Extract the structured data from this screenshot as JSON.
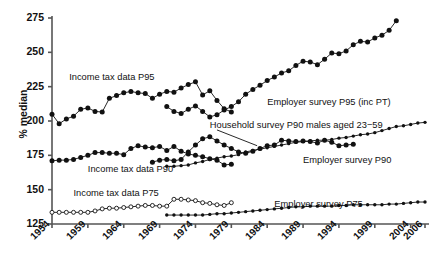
{
  "chart_data": {
    "type": "line",
    "title": "",
    "xlabel": "",
    "ylabel": "% median",
    "xlim": [
      1954,
      2006
    ],
    "ylim": [
      125,
      275
    ],
    "yticks": [
      125,
      150,
      175,
      200,
      225,
      250,
      275
    ],
    "xticks": [
      1954,
      1959,
      1964,
      1969,
      1974,
      1979,
      1984,
      1989,
      1994,
      1999,
      2004,
      2006
    ],
    "grid": false,
    "legend_position": "inline-annotations",
    "marker_styles": {
      "income_tax": "filled-circle",
      "household_survey": "filled-circle",
      "employer_survey_p95": "filled-circle",
      "employer_survey_p90": "small-filled-circle",
      "income_tax_p75": "open-circle",
      "employer_survey_p75": "small-filled-circle"
    },
    "annotations": [
      {
        "text": "Income tax data P95",
        "x": 1956.4,
        "y": 231.5
      },
      {
        "text": "Income tax data P90",
        "x": 1959.0,
        "y": 164.0
      },
      {
        "text": "Income tax data P75",
        "x": 1957.0,
        "y": 146.5
      },
      {
        "text": "Employer survey P95 (inc PT)",
        "x": 1984.0,
        "y": 213.0
      },
      {
        "text": "Household survey P90 males aged 23−59",
        "x": 1976.0,
        "y": 196.5
      },
      {
        "text": "Employer survey P90",
        "x": 1989.0,
        "y": 171.0
      },
      {
        "text": "Employer survey P75",
        "x": 1985.0,
        "y": 139.0
      }
    ],
    "series": [
      {
        "name": "Income tax data P95",
        "marker": "filled-circle",
        "x": [
          1954,
          1955,
          1956,
          1957,
          1958,
          1959,
          1960,
          1961,
          1962,
          1963,
          1964,
          1965,
          1966,
          1967,
          1968,
          1969,
          1970,
          1971,
          1972,
          1973,
          1974,
          1975,
          1976,
          1977,
          1978,
          1979
        ],
        "values": [
          205.0,
          198.0,
          201.5,
          203.5,
          208.5,
          209.5,
          207.0,
          206.5,
          216.5,
          218.5,
          220.5,
          221.5,
          220.5,
          220.0,
          216.5,
          219.5,
          221.5,
          221.0,
          224.0,
          226.5,
          228.5,
          219.0,
          222.0,
          215.0,
          209.0,
          206.5
        ]
      },
      {
        "name": "Income tax data P90",
        "marker": "filled-circle",
        "x": [
          1954,
          1955,
          1956,
          1957,
          1958,
          1959,
          1960,
          1961,
          1962,
          1963,
          1964,
          1965,
          1966,
          1967,
          1968,
          1969,
          1970,
          1971,
          1972,
          1973,
          1974,
          1975,
          1976,
          1977,
          1978,
          1979
        ],
        "values": [
          171.0,
          171.5,
          171.5,
          172.0,
          173.5,
          175.0,
          177.0,
          177.0,
          176.5,
          176.5,
          175.5,
          180.0,
          182.0,
          181.0,
          180.5,
          181.5,
          178.5,
          181.5,
          178.0,
          176.0,
          175.0,
          174.0,
          172.5,
          171.5,
          168.0,
          168.5
        ]
      },
      {
        "name": "Income tax data P75",
        "marker": "open-circle",
        "x": [
          1954,
          1955,
          1956,
          1957,
          1958,
          1959,
          1960,
          1961,
          1962,
          1963,
          1964,
          1965,
          1966,
          1967,
          1968,
          1969,
          1970,
          1971,
          1972,
          1973,
          1974,
          1975,
          1976,
          1977,
          1978,
          1979
        ],
        "values": [
          133.5,
          133.5,
          133.5,
          133.5,
          133.5,
          133.5,
          134.5,
          136.0,
          136.5,
          136.5,
          137.0,
          137.5,
          138.0,
          138.5,
          138.5,
          138.0,
          138.0,
          143.0,
          143.0,
          142.5,
          142.0,
          140.5,
          140.0,
          139.0,
          138.5,
          140.5
        ]
      },
      {
        "name": "Household survey P90 males aged 23−59",
        "marker": "filled-circle",
        "x": [
          1968,
          1969,
          1970,
          1971,
          1972,
          1973,
          1974,
          1975,
          1976,
          1977,
          1978,
          1979,
          1980,
          1981,
          1982,
          1983,
          1984,
          1985,
          1986,
          1987,
          1988,
          1989,
          1990,
          1991,
          1992,
          1993,
          1994,
          1995,
          1996
        ],
        "values": [
          170.0,
          171.5,
          172.0,
          171.0,
          172.0,
          177.5,
          182.5,
          187.0,
          188.5,
          185.5,
          182.5,
          180.0,
          177.5,
          176.5,
          178.0,
          180.0,
          182.0,
          182.5,
          186.0,
          185.5,
          185.0,
          185.5,
          185.0,
          184.0,
          186.0,
          184.5,
          182.0,
          182.5,
          183.0
        ]
      },
      {
        "name": "Employer survey P95 (inc PT)",
        "marker": "filled-circle",
        "x": [
          1970,
          1971,
          1972,
          1973,
          1974,
          1975,
          1976,
          1977,
          1978,
          1979,
          1980,
          1981,
          1982,
          1983,
          1984,
          1985,
          1986,
          1987,
          1988,
          1989,
          1990,
          1991,
          1992,
          1993,
          1994,
          1995,
          1996,
          1997,
          1998,
          1999,
          2000,
          2001,
          2002
        ],
        "values": [
          210.5,
          207.0,
          205.5,
          208.5,
          211.0,
          207.0,
          203.0,
          204.5,
          208.0,
          210.5,
          214.0,
          219.5,
          223.0,
          226.0,
          229.5,
          232.0,
          235.0,
          236.5,
          240.5,
          243.5,
          243.0,
          241.0,
          245.0,
          249.5,
          249.0,
          251.0,
          255.5,
          258.0,
          257.5,
          260.5,
          262.5,
          266.0,
          273.0
        ]
      },
      {
        "name": "Employer survey P90",
        "marker": "small-filled-circle",
        "x": [
          1970,
          1971,
          1972,
          1973,
          1974,
          1975,
          1976,
          1977,
          1978,
          1979,
          1980,
          1981,
          1982,
          1983,
          1984,
          1985,
          1986,
          1987,
          1988,
          1989,
          1990,
          1991,
          1992,
          1993,
          1994,
          1995,
          1996,
          1997,
          1998,
          1999,
          2000,
          2001,
          2002,
          2003,
          2004,
          2005,
          2006
        ],
        "values": [
          167.0,
          167.0,
          167.5,
          168.0,
          169.5,
          170.5,
          172.0,
          173.0,
          174.0,
          174.5,
          175.5,
          177.5,
          178.5,
          179.5,
          180.5,
          181.5,
          182.5,
          183.5,
          184.5,
          185.0,
          185.5,
          186.0,
          186.0,
          186.5,
          187.5,
          188.0,
          189.0,
          190.0,
          190.5,
          191.5,
          193.0,
          194.5,
          196.0,
          196.5,
          197.5,
          198.5,
          199.0
        ]
      },
      {
        "name": "Employer survey P75",
        "marker": "small-filled-circle",
        "x": [
          1970,
          1971,
          1972,
          1973,
          1974,
          1975,
          1976,
          1977,
          1978,
          1979,
          1980,
          1981,
          1982,
          1983,
          1984,
          1985,
          1986,
          1987,
          1988,
          1989,
          1990,
          1991,
          1992,
          1993,
          1994,
          1995,
          1996,
          1997,
          1998,
          1999,
          2000,
          2001,
          2002,
          2003,
          2004,
          2005,
          2006
        ],
        "values": [
          131.5,
          131.5,
          131.5,
          131.5,
          131.5,
          131.5,
          132.0,
          132.5,
          132.5,
          133.0,
          133.5,
          134.0,
          134.5,
          135.0,
          135.5,
          136.0,
          136.5,
          137.0,
          137.5,
          137.5,
          138.0,
          138.0,
          138.0,
          138.0,
          138.5,
          138.5,
          139.0,
          139.0,
          139.0,
          139.0,
          139.0,
          139.5,
          139.5,
          140.0,
          140.5,
          141.0,
          141.0
        ]
      }
    ],
    "connector_lines": [
      {
        "from": {
          "x": 1977.0,
          "y": 193.5
        },
        "to": {
          "x": 1982.6,
          "y": 182.0
        }
      }
    ],
    "colors": {
      "line": "#111111",
      "marker_fill": "#111111",
      "marker_open_fill": "#ffffff",
      "axis": "#555555",
      "text": "#111111",
      "background": "#ffffff"
    }
  }
}
